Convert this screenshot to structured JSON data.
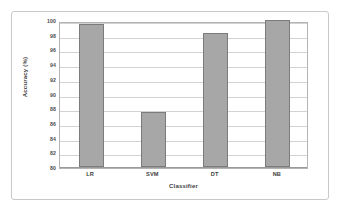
{
  "chart_data": {
    "type": "bar",
    "title": "",
    "xlabel": "Classifier",
    "ylabel": "Accuracy (%)",
    "categories": [
      "LR",
      "SVM",
      "DT",
      "NB"
    ],
    "values": [
      99.4,
      87.5,
      98.2,
      100.0
    ],
    "ylim": [
      80,
      100
    ],
    "ytick_labels": [
      "100",
      "98",
      "96",
      "94",
      "92",
      "90",
      "88",
      "86",
      "84",
      "82",
      "80"
    ],
    "ytick_values": [
      100,
      98,
      96,
      94,
      92,
      90,
      88,
      86,
      84,
      82,
      80
    ],
    "ytick_step": 2,
    "grid": true,
    "legend": false,
    "series": [
      {
        "name": "Accuracy",
        "values": [
          99.4,
          87.5,
          98.2,
          100.0
        ]
      }
    ]
  },
  "style": {
    "bar_fill": "#a7a7a7",
    "bar_border": "#7b7b7b",
    "gridline_color": "#d2d2d2",
    "plot_border": "#b4b4b4",
    "figure_border": "#c9c9c9",
    "background": "#ffffff",
    "text_color": "#3d3d3d"
  }
}
